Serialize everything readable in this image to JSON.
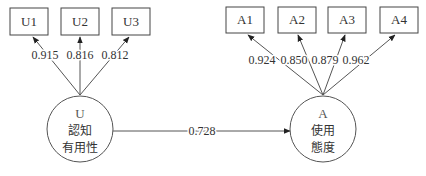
{
  "diagram": {
    "type": "structural-equation-model",
    "latent_constructs": [
      {
        "id": "U",
        "code": "U",
        "line1": "認知",
        "line2": "有用性"
      },
      {
        "id": "A",
        "code": "A",
        "line1": "使用",
        "line2": "態度"
      }
    ],
    "indicators": {
      "U": [
        {
          "label": "U1",
          "loading": "0.915"
        },
        {
          "label": "U2",
          "loading": "0.816"
        },
        {
          "label": "U3",
          "loading": "0.812"
        }
      ],
      "A": [
        {
          "label": "A1",
          "loading": "0.924"
        },
        {
          "label": "A2",
          "loading": "0.850"
        },
        {
          "label": "A3",
          "loading": "0.879"
        },
        {
          "label": "A4",
          "loading": "0.962"
        }
      ]
    },
    "paths": [
      {
        "from": "U",
        "to": "A",
        "coefficient": "0.728"
      }
    ],
    "colors": {
      "line": "#555555",
      "box_border": "#444444",
      "text": "#333333",
      "background": "#ffffff"
    }
  }
}
